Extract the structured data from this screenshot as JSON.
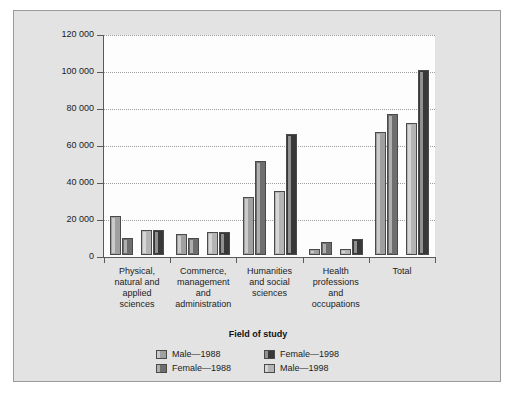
{
  "chart_data": {
    "type": "bar",
    "title": "",
    "xlabel": "Field of study",
    "ylabel": "",
    "ylim": [
      0,
      120000
    ],
    "ytick_values": [
      0,
      20000,
      40000,
      60000,
      80000,
      100000,
      120000
    ],
    "ytick_labels": [
      "0",
      "20 000",
      "40 000",
      "60 000",
      "80 000",
      "100 000",
      "120 000"
    ],
    "grid": "horizontal-dotted",
    "legend_position": "bottom-center",
    "categories": [
      "Physical, natural and applied sciences",
      "Commerce, management and administration",
      "Humanities and social sciences",
      "Health professions and occupations",
      "Total"
    ],
    "category_label_lines": [
      [
        "Physical,",
        "natural and",
        "applied",
        "sciences"
      ],
      [
        "Commerce,",
        "management",
        "and",
        "administration"
      ],
      [
        "Humanities",
        "and social",
        "sciences"
      ],
      [
        "Health",
        "professions",
        "and",
        "occupations"
      ],
      [
        "Total"
      ]
    ],
    "series": [
      {
        "name": "Male—1988",
        "color": "#a0a0a0",
        "values": [
          21000,
          11500,
          31500,
          3200,
          66500
        ]
      },
      {
        "name": "Female—1988",
        "color": "#6e6e6e",
        "values": [
          9400,
          9000,
          51000,
          7200,
          76000
        ]
      },
      {
        "name": "Male—1998",
        "color": "#b4b4b4",
        "values": [
          13500,
          12300,
          34500,
          3300,
          71500
        ]
      },
      {
        "name": "Female—1998",
        "color": "#383838",
        "values": [
          13500,
          12400,
          65500,
          8800,
          100000
        ]
      }
    ],
    "legend_entries": [
      {
        "label": "Male—1988",
        "color": "#a0a0a0"
      },
      {
        "label": "Female—1998",
        "color": "#383838"
      },
      {
        "label": "Female—1988",
        "color": "#6e6e6e"
      },
      {
        "label": "Male—1998",
        "color": "#b4b4b4"
      }
    ],
    "colors": {
      "page_background": "#ffffff",
      "figure_background": "#e3e3e3",
      "plot_background": "#fdfdfd",
      "axis": "#5a5a5a",
      "gridline": "#9e9e9e",
      "text": "#1c1c1c"
    }
  }
}
